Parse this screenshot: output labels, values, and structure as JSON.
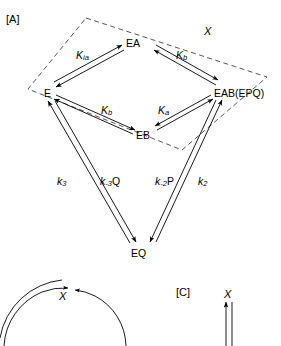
{
  "figure": {
    "panel_a_tag": "[A]",
    "panel_c_tag": "[C]",
    "type": "reaction-scheme"
  },
  "panelA": {
    "nodes": {
      "e": "E",
      "ea": "EA",
      "eb": "EB",
      "eab": "EAB(EPQ)",
      "eq": "EQ"
    },
    "equilibrium_labels": {
      "k_ia": {
        "base": "K",
        "sub": "ia"
      },
      "k_b_top": {
        "base": "K",
        "sub": "b"
      },
      "k_b_bottom": {
        "base": "K",
        "sub": "b"
      },
      "k_a_bottom": {
        "base": "K",
        "sub": "a"
      }
    },
    "rate_labels": {
      "k3": {
        "base": "k",
        "sub": "3",
        "suffix": ""
      },
      "k_minus3Q": {
        "base": "k",
        "sub": "-3",
        "suffix": "Q"
      },
      "k_minus2P": {
        "base": "k",
        "sub": "-2",
        "suffix": "P"
      },
      "k2": {
        "base": "k",
        "sub": "2",
        "suffix": ""
      }
    },
    "box_label": "X"
  },
  "panelB": {
    "cycle_label": "X"
  },
  "panelC": {
    "arrow_label": "X"
  },
  "colors": {
    "stroke": "#000000",
    "background": "#ffffff",
    "dashed": "#555555"
  }
}
